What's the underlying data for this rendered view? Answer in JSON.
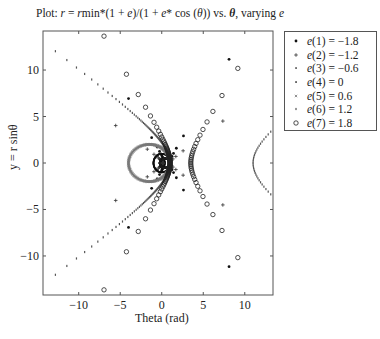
{
  "chart_data": {
    "type": "scatter",
    "title": "Plot: r = rmin*(1 + e)/(1 + e* cos (θ)) vs. θ, varying e",
    "title_parts": {
      "prefix": "Plot: ",
      "formula": "r = r",
      "rest": "min*(1 + e)/(1 + e* cos (θ)) vs. θ, varying e"
    },
    "xlabel": "Theta (rad)",
    "ylabel": "y = r sinθ",
    "xlim": [
      -14.3,
      13.4
    ],
    "ylim": [
      -14.2,
      14.2
    ],
    "xticks": [
      -10,
      -5,
      0,
      5,
      10
    ],
    "yticks": [
      -10,
      -5,
      0,
      5,
      10
    ],
    "grid": false,
    "legend_position": "outside-right-top",
    "equation": "r = rmin*(1+e)/(1+e*cos(theta)); x = r*cos(theta), y = r*sin(theta)",
    "rmin": 1,
    "series": [
      {
        "name": "e(1) = −1.8",
        "e": -1.8,
        "marker": "dot",
        "color": "#111111",
        "n": 60
      },
      {
        "name": "e(2) = −1.2",
        "e": -1.2,
        "marker": "plus",
        "color": "#333333",
        "n": 80
      },
      {
        "name": "e(3) = −0.6",
        "e": -0.6,
        "marker": "smalldot",
        "color": "#222222",
        "n": 700
      },
      {
        "name": "e(4) = 0",
        "e": 0,
        "marker": "smalldot",
        "color": "#111111",
        "n": 200
      },
      {
        "name": "e(5) = 0.6",
        "e": 0.6,
        "marker": "x",
        "color": "#777777",
        "n": 400
      },
      {
        "name": "e(6) = 1.2",
        "e": 1.2,
        "marker": "tick",
        "color": "#555555",
        "n": 400
      },
      {
        "name": "e(7) = 1.8",
        "e": 1.8,
        "marker": "circle",
        "color": "#222222",
        "n": 120
      }
    ]
  },
  "legend": {
    "items": [
      {
        "prefix": "e",
        "label": "(1) = −1.8"
      },
      {
        "prefix": "e",
        "label": "(2) = −1.2"
      },
      {
        "prefix": "e",
        "label": "(3) = −0.6"
      },
      {
        "prefix": "e",
        "label": "(4) = 0"
      },
      {
        "prefix": "e",
        "label": "(5) = 0.6"
      },
      {
        "prefix": "e",
        "label": "(6) = 1.2"
      },
      {
        "prefix": "e",
        "label": "(7) = 1.8"
      }
    ]
  },
  "axes": {
    "xlabel": "Theta (rad)",
    "ylabel": "y = r sinθ",
    "xtick_labels": [
      "−10",
      "−5",
      "0",
      "5",
      "10"
    ],
    "ytick_labels": [
      "10",
      "5",
      "0",
      "−5",
      "−10"
    ]
  },
  "title": {
    "lead": "Plot: ",
    "r1": "r",
    "eq": " = ",
    "r2": "r",
    "mid": "min*(1 + ",
    "e1": "e",
    "mid2": ")/(1 + ",
    "e2": "e",
    "mid3": "* cos (",
    "th1": "θ",
    "mid4": ")) vs. ",
    "th2": "θ",
    "mid5": ", varying ",
    "e3": "e"
  }
}
